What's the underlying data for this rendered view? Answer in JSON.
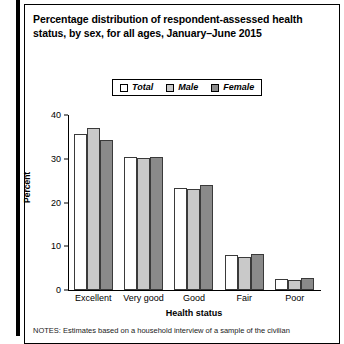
{
  "figure": {
    "title": "Percentage distribution of respondent-assessed health status, by sex, for all ages, January–June 2015",
    "footnote": "NOTES: Estimates based on a household interview of a sample of the civilian"
  },
  "legend": {
    "items": [
      {
        "label": "Total",
        "color": "#ffffff"
      },
      {
        "label": "Male",
        "color": "#c9c9c9"
      },
      {
        "label": "Female",
        "color": "#8a8a8a"
      }
    ]
  },
  "axes": {
    "y_label": "Percent",
    "y_ticks": [
      "0",
      "10",
      "20",
      "30",
      "40"
    ],
    "x_label": "Health status"
  },
  "chart_data": {
    "type": "bar",
    "title": "Percentage distribution of respondent-assessed health status, by sex, for all ages, January–June 2015",
    "xlabel": "Health status",
    "ylabel": "Percent",
    "ylim": [
      0,
      40
    ],
    "yticks": [
      0,
      10,
      20,
      30,
      40
    ],
    "grid": false,
    "legend_position": "top-center",
    "categories": [
      "Excellent",
      "Very good",
      "Good",
      "Fair",
      "Poor"
    ],
    "series": [
      {
        "name": "Total",
        "color": "#ffffff",
        "values": [
          35.6,
          30.3,
          23.3,
          7.9,
          2.6
        ]
      },
      {
        "name": "Male",
        "color": "#c9c9c9",
        "values": [
          37.0,
          30.2,
          23.0,
          7.6,
          2.4
        ]
      },
      {
        "name": "Female",
        "color": "#8a8a8a",
        "values": [
          34.2,
          30.3,
          24.0,
          8.2,
          2.8
        ]
      }
    ],
    "notes": "NOTES: Estimates based on a household interview of a sample of the civilian"
  }
}
